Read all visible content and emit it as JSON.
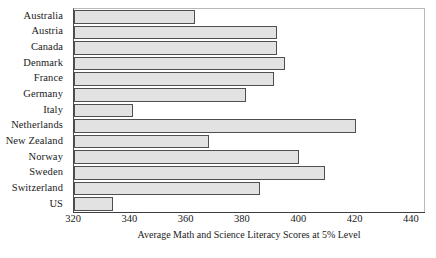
{
  "chart_data": {
    "type": "bar",
    "orientation": "horizontal",
    "title": "",
    "xlabel": "Average Math and Science Literacy Scores at 5% Level",
    "ylabel": "",
    "xlim": [
      320,
      445
    ],
    "xticks": [
      320,
      340,
      360,
      380,
      400,
      420,
      440
    ],
    "grid": false,
    "legend": null,
    "categories": [
      "Australia",
      "Austria",
      "Canada",
      "Denmark",
      "France",
      "Germany",
      "Italy",
      "Netherlands",
      "New Zealand",
      "Norway",
      "Sweden",
      "Switzerland",
      "US"
    ],
    "values": [
      363,
      392,
      392,
      395,
      391,
      381,
      341,
      420,
      368,
      400,
      409,
      386,
      334
    ],
    "bar_color": "#e2e2e2",
    "bar_edge_color": "#4f4f4f"
  }
}
